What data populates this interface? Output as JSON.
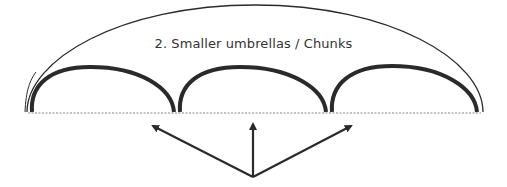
{
  "diagram": {
    "title": "2.  Smaller umbrellas / Chunks",
    "big_umbrella": {
      "left": 26,
      "right": 483,
      "top": 5,
      "baseline": 112
    },
    "chunks": [
      {
        "label": "chunk-1",
        "left": 30,
        "right": 175
      },
      {
        "label": "chunk-2",
        "left": 178,
        "right": 327
      },
      {
        "label": "chunk-3",
        "left": 330,
        "right": 478
      }
    ],
    "arrows": {
      "origin": [
        253,
        177
      ],
      "targets": [
        [
          150,
          124
        ],
        [
          253,
          121
        ],
        [
          354,
          124
        ]
      ]
    },
    "colors": {
      "stroke": "#2a2a2a",
      "dotted": "#888888",
      "text": "#333333"
    }
  }
}
